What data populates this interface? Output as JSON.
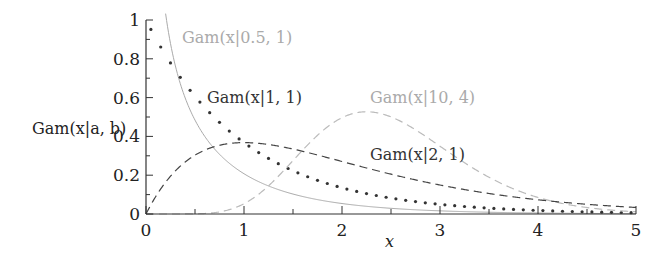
{
  "chart_data": {
    "type": "line",
    "title": "",
    "xlabel": "x",
    "ylabel": "Gam(x|a, b)",
    "xlim": [
      0,
      5
    ],
    "ylim": [
      0,
      1
    ],
    "grid": false,
    "legend": "inline labels",
    "x_ticks": [
      "0",
      "1",
      "2",
      "3",
      "4",
      "5"
    ],
    "y_ticks": [
      "0",
      "0.2",
      "0.4",
      "0.6",
      "0.8",
      "1"
    ],
    "series": [
      {
        "name": "Gam(x|0.5, 1)",
        "a": 0.5,
        "b": 1,
        "style": "solid",
        "color": "#aaaaaa",
        "label_pos": {
          "x": 0.42,
          "y": 0.93
        }
      },
      {
        "name": "Gam(x|1, 1)",
        "a": 1,
        "b": 1,
        "style": "dotted",
        "color": "#333333",
        "label_pos": {
          "x": 0.67,
          "y": 0.58
        }
      },
      {
        "name": "Gam(x|10, 4)",
        "a": 10,
        "b": 4,
        "style": "dashed",
        "color": "#bbbbbb",
        "label_pos": {
          "x": 2.2,
          "y": 0.58
        }
      },
      {
        "name": "Gam(x|2, 1)",
        "a": 2,
        "b": 1,
        "style": "dashed",
        "color": "#444444",
        "label_pos": {
          "x": 2.2,
          "y": 0.25
        }
      }
    ]
  },
  "labels": {
    "ylabel": "Gam(x|a, b)",
    "xlabel": "x",
    "curve1": "Gam(x|0.5, 1)",
    "curve2": "Gam(x|1, 1)",
    "curve3": "Gam(x|10, 4)",
    "curve4": "Gam(x|2, 1)"
  }
}
